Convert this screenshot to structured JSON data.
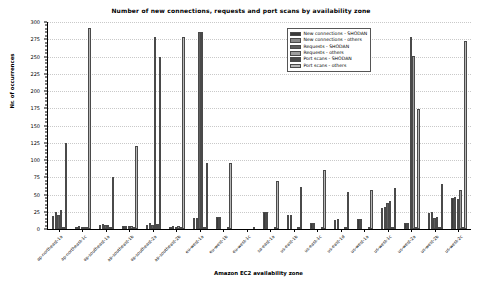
{
  "chart_data": {
    "type": "bar",
    "title": "Number of new connections, requests and port scans by availability zone",
    "xlabel": "Amazon EC2 availability zone",
    "ylabel": "Nr. of occurrences",
    "ylim": [
      0,
      300
    ],
    "ytick_step": 25,
    "yticks": [
      0,
      25,
      50,
      75,
      100,
      125,
      150,
      175,
      200,
      225,
      250,
      275,
      300
    ],
    "ytick_labels": [
      "0",
      "25",
      "50",
      "75",
      "100",
      "125",
      "150",
      "175",
      "200",
      "225",
      "250",
      "275",
      "300"
    ],
    "grid": true,
    "legend_position": "upper right",
    "categories": [
      "ap-northeast-1a",
      "ap-northeast-1c",
      "ap-southeast-1a",
      "ap-southeast-1b",
      "ap-southeast-2a",
      "ap-southeast-2b",
      "eu-west-1a",
      "eu-west-1b",
      "eu-west-1c",
      "sa-east-1a",
      "us-east-1b",
      "us-east-1c",
      "us-east-1d",
      "us-west-1a",
      "us-west-1c",
      "us-west-2a",
      "us-west-2b",
      "us-west-2c"
    ],
    "series": [
      {
        "name": "New connections - SHODAN",
        "color": "#3a3a3a",
        "values": [
          19,
          3,
          6,
          4,
          6,
          3,
          16,
          17,
          0,
          24,
          20,
          8,
          13,
          15,
          31,
          9,
          23,
          45
        ]
      },
      {
        "name": "New connections - others",
        "color": "#8a8a8a",
        "values": [
          24,
          4,
          7,
          5,
          8,
          4,
          16,
          18,
          0,
          25,
          20,
          9,
          14,
          15,
          32,
          9,
          24,
          47
        ]
      },
      {
        "name": "Requests - SHODAN",
        "color": "#5e5e5e",
        "values": [
          21,
          3,
          6,
          4,
          6,
          3,
          286,
          0,
          0,
          0,
          0,
          0,
          0,
          0,
          38,
          279,
          16,
          43
        ]
      },
      {
        "name": "Requests - others",
        "color": "#9e9e9e",
        "values": [
          28,
          3,
          6,
          4,
          279,
          4,
          285,
          0,
          0,
          0,
          0,
          0,
          0,
          0,
          41,
          251,
          17,
          56
        ]
      },
      {
        "name": "Port scans - SHODAN",
        "color": "#4a4a4a",
        "values": [
          3,
          2,
          2,
          2,
          7,
          2,
          2,
          2,
          0,
          2,
          2,
          3,
          2,
          2,
          3,
          2,
          2,
          3
        ]
      },
      {
        "name": "Port scans - others",
        "color": "#b8b8b8",
        "values": [
          125,
          292,
          76,
          120,
          249,
          279,
          95,
          95,
          1,
          69,
          61,
          86,
          53,
          57,
          60,
          174,
          65,
          273
        ]
      }
    ]
  }
}
